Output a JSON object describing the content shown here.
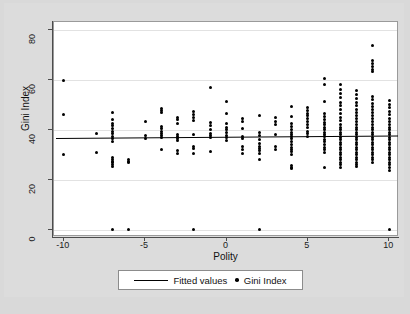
{
  "chart_data": {
    "type": "scatter",
    "title": "",
    "xlabel": "Polity",
    "ylabel": "Gini Index",
    "xlim": [
      -10.6,
      10.6
    ],
    "ylim": [
      -3,
      83
    ],
    "xticks": [
      -10,
      -5,
      0,
      5,
      10
    ],
    "xtick_labels": [
      "-10",
      "-5",
      "0",
      "5",
      "10"
    ],
    "yticks": [
      0,
      20,
      40,
      60,
      80
    ],
    "ytick_labels": [
      "0",
      "20",
      "40",
      "60",
      "80"
    ],
    "grid": "horizontal",
    "legend_position": "below-axis-center",
    "legend": [
      {
        "marker": "line",
        "label": "Fitted values"
      },
      {
        "marker": "dot",
        "label": "Gini Index"
      }
    ],
    "series": [
      {
        "name": "Gini Index",
        "marker": "dot",
        "color": "#000000",
        "points": [
          [
            -10,
            59.6
          ],
          [
            -10,
            46.0
          ],
          [
            -10,
            30.0
          ],
          [
            -8,
            38.4
          ],
          [
            -8,
            30.7
          ],
          [
            -7,
            46.8
          ],
          [
            -7,
            44.0
          ],
          [
            -7,
            42.6
          ],
          [
            -7,
            41.5
          ],
          [
            -7,
            40.3
          ],
          [
            -7,
            39.2
          ],
          [
            -7,
            38.3
          ],
          [
            -7,
            37.4
          ],
          [
            -7,
            36.5
          ],
          [
            -7,
            35.3
          ],
          [
            -7,
            28.8
          ],
          [
            -7,
            28.0
          ],
          [
            -7,
            27.4
          ],
          [
            -7,
            26.8
          ],
          [
            -7,
            26.2
          ],
          [
            -7,
            25.4
          ],
          [
            -7,
            0.0
          ],
          [
            -6,
            27.9
          ],
          [
            -6,
            27.2
          ],
          [
            -6,
            26.8
          ],
          [
            -6,
            0.0
          ],
          [
            -5,
            43.2
          ],
          [
            -5,
            37.5
          ],
          [
            -5,
            36.6
          ],
          [
            -4,
            48.4
          ],
          [
            -4,
            47.6
          ],
          [
            -4,
            46.8
          ],
          [
            -4,
            41.4
          ],
          [
            -4,
            40.3
          ],
          [
            -4,
            39.2
          ],
          [
            -4,
            38.3
          ],
          [
            -4,
            37.6
          ],
          [
            -4,
            36.9
          ],
          [
            -4,
            32.0
          ],
          [
            -3,
            45.0
          ],
          [
            -3,
            44.0
          ],
          [
            -3,
            42.6
          ],
          [
            -3,
            38.2
          ],
          [
            -3,
            37.4
          ],
          [
            -3,
            36.5
          ],
          [
            -3,
            35.5
          ],
          [
            -3,
            31.5
          ],
          [
            -3,
            30.6
          ],
          [
            -2,
            47.2
          ],
          [
            -2,
            46.2
          ],
          [
            -2,
            45.0
          ],
          [
            -2,
            43.6
          ],
          [
            -2,
            37.9
          ],
          [
            -2,
            33.2
          ],
          [
            -2,
            32.4
          ],
          [
            -2,
            30.6
          ],
          [
            -2,
            0.0
          ],
          [
            -1,
            56.8
          ],
          [
            -1,
            43.0
          ],
          [
            -1,
            41.8
          ],
          [
            -1,
            40.0
          ],
          [
            -1,
            38.4
          ],
          [
            -1,
            37.6
          ],
          [
            -1,
            36.9
          ],
          [
            -1,
            31.3
          ],
          [
            0,
            51.4
          ],
          [
            0,
            46.6
          ],
          [
            0,
            42.6
          ],
          [
            0,
            41.0
          ],
          [
            0,
            40.0
          ],
          [
            0,
            38.8
          ],
          [
            0,
            37.7
          ],
          [
            0,
            36.8
          ],
          [
            0,
            35.6
          ],
          [
            1,
            44.6
          ],
          [
            1,
            43.1
          ],
          [
            1,
            40.4
          ],
          [
            1,
            37.3
          ],
          [
            1,
            36.4
          ],
          [
            1,
            33.3
          ],
          [
            1,
            32.1
          ],
          [
            1,
            30.3
          ],
          [
            2,
            45.8
          ],
          [
            2,
            38.8
          ],
          [
            2,
            37.6
          ],
          [
            2,
            36.2
          ],
          [
            2,
            34.6
          ],
          [
            2,
            33.4
          ],
          [
            2,
            32.4
          ],
          [
            2,
            31.5
          ],
          [
            2,
            30.6
          ],
          [
            2,
            27.9
          ],
          [
            2,
            0.0
          ],
          [
            3,
            45.0
          ],
          [
            3,
            43.4
          ],
          [
            3,
            42.2
          ],
          [
            3,
            38.0
          ],
          [
            3,
            33.2
          ],
          [
            3,
            32.1
          ],
          [
            4,
            49.4
          ],
          [
            4,
            45.2
          ],
          [
            4,
            42.6
          ],
          [
            4,
            41.2
          ],
          [
            4,
            40.2
          ],
          [
            4,
            39.0
          ],
          [
            4,
            38.2
          ],
          [
            4,
            37.4
          ],
          [
            4,
            36.4
          ],
          [
            4,
            35.4
          ],
          [
            4,
            34.0
          ],
          [
            4,
            33.0
          ],
          [
            4,
            32.0
          ],
          [
            4,
            31.1
          ],
          [
            4,
            30.2
          ],
          [
            4,
            25.6
          ],
          [
            4,
            24.9
          ],
          [
            4,
            24.3
          ],
          [
            5,
            49.0
          ],
          [
            5,
            47.8
          ],
          [
            5,
            46.6
          ],
          [
            5,
            45.6
          ],
          [
            5,
            44.6
          ],
          [
            5,
            43.4
          ],
          [
            5,
            42.2
          ],
          [
            5,
            41.0
          ],
          [
            5,
            39.2
          ],
          [
            5,
            38.4
          ],
          [
            5,
            37.2
          ],
          [
            6,
            60.6
          ],
          [
            6,
            58.0
          ],
          [
            6,
            51.4
          ],
          [
            6,
            46.4
          ],
          [
            6,
            45.4
          ],
          [
            6,
            44.2
          ],
          [
            6,
            43.0
          ],
          [
            6,
            42.0
          ],
          [
            6,
            41.0
          ],
          [
            6,
            40.0
          ],
          [
            6,
            39.0
          ],
          [
            6,
            38.2
          ],
          [
            6,
            37.2
          ],
          [
            6,
            36.2
          ],
          [
            6,
            35.2
          ],
          [
            6,
            34.2
          ],
          [
            6,
            33.0
          ],
          [
            6,
            32.0
          ],
          [
            6,
            31.0
          ],
          [
            6,
            25.0
          ],
          [
            7,
            58.0
          ],
          [
            7,
            56.2
          ],
          [
            7,
            54.4
          ],
          [
            7,
            52.8
          ],
          [
            7,
            51.0
          ],
          [
            7,
            49.6
          ],
          [
            7,
            48.0
          ],
          [
            7,
            46.6
          ],
          [
            7,
            45.0
          ],
          [
            7,
            43.6
          ],
          [
            7,
            42.2
          ],
          [
            7,
            41.0
          ],
          [
            7,
            40.0
          ],
          [
            7,
            39.0
          ],
          [
            7,
            38.0
          ],
          [
            7,
            37.0
          ],
          [
            7,
            36.0
          ],
          [
            7,
            35.0
          ],
          [
            7,
            34.0
          ],
          [
            7,
            33.0
          ],
          [
            7,
            32.0
          ],
          [
            7,
            31.0
          ],
          [
            7,
            30.0
          ],
          [
            7,
            29.0
          ],
          [
            7,
            28.0
          ],
          [
            7,
            27.0
          ],
          [
            7,
            26.0
          ],
          [
            7,
            25.0
          ],
          [
            8,
            55.8
          ],
          [
            8,
            54.0
          ],
          [
            8,
            52.4
          ],
          [
            8,
            51.0
          ],
          [
            8,
            49.6
          ],
          [
            8,
            48.2
          ],
          [
            8,
            47.0
          ],
          [
            8,
            45.8
          ],
          [
            8,
            44.6
          ],
          [
            8,
            43.4
          ],
          [
            8,
            42.2
          ],
          [
            8,
            41.0
          ],
          [
            8,
            40.0
          ],
          [
            8,
            39.0
          ],
          [
            8,
            38.0
          ],
          [
            8,
            37.0
          ],
          [
            8,
            36.0
          ],
          [
            8,
            35.0
          ],
          [
            8,
            34.0
          ],
          [
            8,
            33.0
          ],
          [
            8,
            32.0
          ],
          [
            8,
            31.0
          ],
          [
            8,
            30.0
          ],
          [
            8,
            29.0
          ],
          [
            8,
            28.0
          ],
          [
            8,
            27.0
          ],
          [
            8,
            26.0
          ],
          [
            8,
            25.2
          ],
          [
            9,
            73.8
          ],
          [
            9,
            67.6
          ],
          [
            9,
            66.4
          ],
          [
            9,
            65.4
          ],
          [
            9,
            64.2
          ],
          [
            9,
            63.4
          ],
          [
            9,
            53.4
          ],
          [
            9,
            52.0
          ],
          [
            9,
            50.6
          ],
          [
            9,
            49.2
          ],
          [
            9,
            48.0
          ],
          [
            9,
            46.8
          ],
          [
            9,
            45.6
          ],
          [
            9,
            44.4
          ],
          [
            9,
            43.2
          ],
          [
            9,
            42.0
          ],
          [
            9,
            41.0
          ],
          [
            9,
            40.0
          ],
          [
            9,
            39.0
          ],
          [
            9,
            38.0
          ],
          [
            9,
            37.0
          ],
          [
            9,
            36.0
          ],
          [
            9,
            35.0
          ],
          [
            9,
            34.0
          ],
          [
            9,
            33.0
          ],
          [
            9,
            32.0
          ],
          [
            9,
            31.0
          ],
          [
            9,
            30.0
          ],
          [
            9,
            29.0
          ],
          [
            9,
            28.0
          ],
          [
            9,
            26.8
          ],
          [
            10,
            51.6
          ],
          [
            10,
            50.2
          ],
          [
            10,
            48.8
          ],
          [
            10,
            47.4
          ],
          [
            10,
            46.0
          ],
          [
            10,
            44.6
          ],
          [
            10,
            43.2
          ],
          [
            10,
            42.0
          ],
          [
            10,
            41.0
          ],
          [
            10,
            40.0
          ],
          [
            10,
            39.0
          ],
          [
            10,
            38.0
          ],
          [
            10,
            37.0
          ],
          [
            10,
            36.0
          ],
          [
            10,
            35.0
          ],
          [
            10,
            34.0
          ],
          [
            10,
            33.0
          ],
          [
            10,
            32.0
          ],
          [
            10,
            31.0
          ],
          [
            10,
            30.0
          ],
          [
            10,
            29.0
          ],
          [
            10,
            28.0
          ],
          [
            10,
            27.0
          ],
          [
            10,
            26.0
          ],
          [
            10,
            25.0
          ],
          [
            10,
            23.6
          ],
          [
            10,
            0.0
          ]
        ]
      }
    ],
    "fit_line": {
      "name": "Fitted values",
      "color": "#000000",
      "x_start": -10.5,
      "x_end": 10.5,
      "y_start": 36.6,
      "y_end": 37.6
    }
  }
}
